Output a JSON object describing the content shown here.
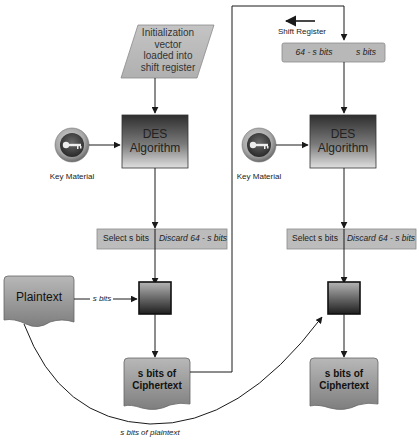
{
  "diagram": {
    "type": "Cipher Feedback (CFB) mode flowchart",
    "colors": {
      "line": "#1a1a1a",
      "box_fill_light": "#c8c8c8",
      "box_fill_dark": "#3a3a3a",
      "doc_fill": "#9a9a9a",
      "key_ring": "#a52a1a"
    },
    "left": {
      "iv_box": "Initialization vector loaded into shift register",
      "iv_lines": [
        "Initialization",
        "vector",
        "loaded into",
        "shift register"
      ],
      "des_line1": "DES",
      "des_line2": "Algorithm",
      "key_label": "Key Material",
      "select_label": "Select s bits",
      "discard_label": "Discard 64 - s bits",
      "plaintext_label": "Plaintext",
      "s_bits_label": "s bits",
      "cipher_line1": "s bits of",
      "cipher_line2": "Ciphertext"
    },
    "right": {
      "shift_register_label": "Shift Register",
      "reg_left": "64 - s bits",
      "reg_right": "s bits",
      "des_line1": "DES",
      "des_line2": "Algorithm",
      "key_label": "Key Material",
      "select_label": "Select s bits",
      "discard_label": "Discard 64 - s bits",
      "cipher_line1": "s bits of",
      "cipher_line2": "Ciphertext"
    },
    "curve_label": "s bits of plaintext"
  }
}
